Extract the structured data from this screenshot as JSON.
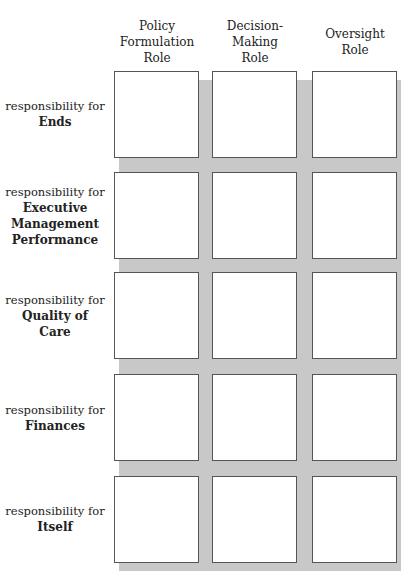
{
  "columns": [
    {
      "label": "Policy Formulation Role",
      "lines": [
        "Policy",
        "Formulation",
        "Role"
      ]
    },
    {
      "label": "Decision-Making Role",
      "lines": [
        "Decision-",
        "Making",
        "Role"
      ]
    },
    {
      "label": "Oversight Role",
      "lines": [
        "Oversight",
        "Role"
      ]
    }
  ],
  "rows": [
    {
      "prefix": "responsibility for",
      "lines": [
        "Ends"
      ]
    },
    {
      "prefix": "responsibility for",
      "lines": [
        "Executive",
        "Management",
        "Performance"
      ]
    },
    {
      "prefix": "responsibility for",
      "lines": [
        "Quality of",
        "Care"
      ]
    },
    {
      "prefix": "responsibility for",
      "lines": [
        "Finances"
      ]
    },
    {
      "prefix": "responsibility for",
      "lines": [
        "Itself"
      ]
    }
  ]
}
